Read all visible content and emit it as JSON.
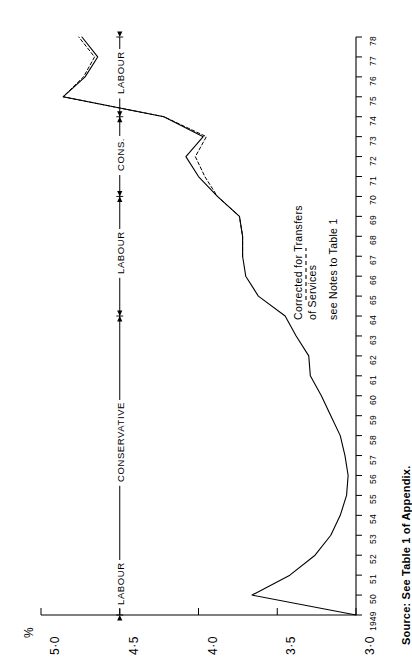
{
  "chart_data": {
    "type": "line",
    "title": "",
    "xlabel": "",
    "ylabel": "%",
    "orientation": "rotated-90-ccw",
    "xlim": [
      1949,
      1978
    ],
    "ylim": [
      3.0,
      5.0
    ],
    "grid": false,
    "x_tick_labels": [
      "1949",
      "50",
      "51",
      "52",
      "53",
      "54",
      "55",
      "56",
      "57",
      "58",
      "59",
      "60",
      "61",
      "62",
      "63",
      "64",
      "65",
      "66",
      "67",
      "68",
      "69",
      "70",
      "71",
      "72",
      "73",
      "74",
      "75",
      "76",
      "77",
      "78"
    ],
    "y_tick_labels": [
      "3·0",
      "3·5",
      "4·0",
      "4·5",
      "5·0"
    ],
    "y_tick_values": [
      3.0,
      3.5,
      4.0,
      4.5,
      5.0
    ],
    "series": [
      {
        "name": "Main series",
        "style": "solid",
        "x": [
          1949,
          1950,
          1951,
          1952,
          1953,
          1954,
          1955,
          1956,
          1957,
          1958,
          1959,
          1960,
          1961,
          1962,
          1963,
          1964,
          1965,
          1966,
          1967,
          1968,
          1969,
          1970,
          1971,
          1972,
          1973,
          1974,
          1975,
          1976,
          1977,
          1978
        ],
        "values": [
          3.0,
          3.66,
          3.42,
          3.26,
          3.16,
          3.1,
          3.06,
          3.05,
          3.07,
          3.1,
          3.16,
          3.22,
          3.29,
          3.3,
          3.38,
          3.45,
          3.62,
          3.7,
          3.72,
          3.72,
          3.74,
          3.88,
          4.0,
          4.08,
          3.97,
          4.22,
          4.86,
          4.72,
          4.64,
          4.74
        ]
      },
      {
        "name": "Corrected for Transfers of Services",
        "style": "dashed",
        "x": [
          1967,
          1968,
          1969,
          1970,
          1971,
          1972,
          1973,
          1974,
          1975,
          1976,
          1977,
          1978
        ],
        "values": [
          3.72,
          3.72,
          3.74,
          3.88,
          3.96,
          4.02,
          3.95,
          4.22,
          4.86,
          4.73,
          4.66,
          4.76
        ]
      }
    ],
    "annotations": {
      "legend": [
        "Corrected for Transfers",
        "of Services",
        "see Notes to Table 1"
      ],
      "source": "Source: See Table 1 of Appendix.",
      "government_periods": [
        {
          "label": "LABOUR",
          "start": 1949,
          "end": 1951
        },
        {
          "label": "CONSERVATIVE",
          "start": 1951,
          "end": 1964
        },
        {
          "label": "LABOUR",
          "start": 1964,
          "end": 1970
        },
        {
          "label": "CONS.",
          "start": 1970,
          "end": 1974
        },
        {
          "label": "LABOUR",
          "start": 1974,
          "end": 1978
        }
      ]
    }
  },
  "colors": {
    "ink": "#000000",
    "background": "#ffffff"
  }
}
